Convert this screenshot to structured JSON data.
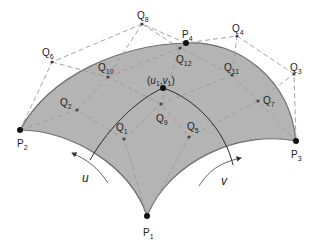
{
  "diagram": {
    "colors": {
      "surface_fill": "#b4b4b4",
      "surface_edge": "#6e6e6e",
      "control_polygon": "#9a9a9a",
      "iso_curve": "#2a2a2a",
      "point": "#111111"
    },
    "corner_points": [
      {
        "id": "P1",
        "base": "P",
        "sub": "1",
        "x": 147,
        "y": 216
      },
      {
        "id": "P2",
        "base": "P",
        "sub": "2",
        "x": 20,
        "y": 130
      },
      {
        "id": "P3",
        "base": "P",
        "sub": "3",
        "x": 296,
        "y": 141
      },
      {
        "id": "P4",
        "base": "P",
        "sub": "4",
        "x": 186,
        "y": 43
      }
    ],
    "control_points": [
      {
        "id": "Q1",
        "base": "Q",
        "sub": "1",
        "x": 124,
        "y": 139
      },
      {
        "id": "Q2",
        "base": "Q",
        "sub": "2",
        "x": 77,
        "y": 110
      },
      {
        "id": "Q3",
        "base": "Q",
        "sub": "3",
        "x": 294,
        "y": 74
      },
      {
        "id": "Q4",
        "base": "Q",
        "sub": "4",
        "x": 237,
        "y": 36
      },
      {
        "id": "Q5",
        "base": "Q",
        "sub": "5",
        "x": 189,
        "y": 137
      },
      {
        "id": "Q6",
        "base": "Q",
        "sub": "6",
        "x": 52,
        "y": 62
      },
      {
        "id": "Q7",
        "base": "Q",
        "sub": "7",
        "x": 258,
        "y": 101
      },
      {
        "id": "Q8",
        "base": "Q",
        "sub": "8",
        "x": 142,
        "y": 24
      },
      {
        "id": "Q9",
        "base": "Q",
        "sub": "9",
        "x": 161,
        "y": 104
      },
      {
        "id": "Q10",
        "base": "Q",
        "sub": "10",
        "x": 108,
        "y": 77
      },
      {
        "id": "Q11",
        "base": "Q",
        "sub": "11",
        "x": 232,
        "y": 75
      },
      {
        "id": "Q12",
        "base": "Q",
        "sub": "12",
        "x": 180,
        "y": 48
      }
    ],
    "parameter_point": {
      "label_open": "(",
      "u": "u",
      "u_sub": "1",
      "sep": " , ",
      "v": "v",
      "v_sub": "1",
      "label_close": ")",
      "x": 163,
      "y": 88
    },
    "parameter_arrows": [
      {
        "label": "u",
        "direction": "toward P2"
      },
      {
        "label": "v",
        "direction": "toward P3"
      }
    ],
    "labels": {
      "P1": "P",
      "P1_sub": "1",
      "P2": "P",
      "P2_sub": "2",
      "P3": "P",
      "P3_sub": "3",
      "P4": "P",
      "P4_sub": "4",
      "Q1": "Q",
      "Q1_sub": "1",
      "Q2": "Q",
      "Q2_sub": "2",
      "Q3": "Q",
      "Q3_sub": "3",
      "Q4": "Q",
      "Q4_sub": "4",
      "Q5": "Q",
      "Q5_sub": "5",
      "Q6": "Q",
      "Q6_sub": "6",
      "Q7": "Q",
      "Q7_sub": "7",
      "Q8": "Q",
      "Q8_sub": "8",
      "Q9": "Q",
      "Q9_sub": "9",
      "Q10": "Q",
      "Q10_sub": "10",
      "Q11": "Q",
      "Q11_sub": "11",
      "Q12": "Q",
      "Q12_sub": "12",
      "uv_open": "(",
      "uv_u": "u",
      "uv_u_sub": "1",
      "uv_comma": ",",
      "uv_v": "v",
      "uv_v_sub": "1",
      "uv_close": ")",
      "u_arrow": "u",
      "v_arrow": "v"
    }
  }
}
